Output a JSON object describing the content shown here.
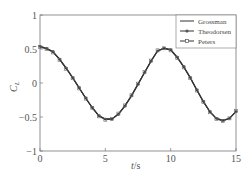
{
  "chart_data": {
    "type": "line",
    "title": "",
    "xlabel": "t/s",
    "ylabel": "C_L",
    "xlim": [
      0,
      15
    ],
    "ylim": [
      -1,
      1
    ],
    "xticks": [
      0,
      5,
      10,
      15
    ],
    "yticks": [
      1,
      0.5,
      0,
      -0.5,
      -1
    ],
    "xtick_labels": [
      "0",
      "5",
      "10",
      "15"
    ],
    "ytick_labels": [
      "1",
      "0.5",
      "0",
      "−0.5",
      "−1"
    ],
    "grid": false,
    "legend_position": "upper right",
    "x": [
      0,
      0.5,
      1,
      1.5,
      2,
      2.5,
      3,
      3.5,
      4,
      4.5,
      5,
      5.5,
      6,
      6.5,
      7,
      7.5,
      8,
      8.5,
      9,
      9.5,
      10,
      10.5,
      11,
      11.5,
      12,
      12.5,
      13,
      13.5,
      14,
      14.5,
      15
    ],
    "series": [
      {
        "name": "Grossman",
        "marker": "none",
        "values": [
          0.54,
          0.51,
          0.46,
          0.35,
          0.22,
          0.08,
          -0.07,
          -0.22,
          -0.36,
          -0.48,
          -0.53,
          -0.53,
          -0.46,
          -0.34,
          -0.19,
          -0.02,
          0.15,
          0.32,
          0.47,
          0.51,
          0.49,
          0.38,
          0.24,
          0.08,
          -0.1,
          -0.27,
          -0.42,
          -0.52,
          -0.55,
          -0.52,
          -0.42
        ]
      },
      {
        "name": "Theodorsen",
        "marker": "circle",
        "values": [
          0.54,
          0.51,
          0.46,
          0.35,
          0.22,
          0.08,
          -0.07,
          -0.22,
          -0.36,
          -0.48,
          -0.53,
          -0.53,
          -0.46,
          -0.34,
          -0.19,
          -0.02,
          0.15,
          0.32,
          0.47,
          0.51,
          0.49,
          0.38,
          0.24,
          0.08,
          -0.1,
          -0.27,
          -0.42,
          -0.52,
          -0.55,
          -0.52,
          -0.42
        ]
      },
      {
        "name": "Peters",
        "marker": "square",
        "values": [
          0.53,
          0.5,
          0.45,
          0.34,
          0.21,
          0.07,
          -0.08,
          -0.23,
          -0.37,
          -0.49,
          -0.54,
          -0.53,
          -0.45,
          -0.33,
          -0.18,
          -0.01,
          0.16,
          0.33,
          0.48,
          0.51,
          0.48,
          0.37,
          0.23,
          0.07,
          -0.11,
          -0.28,
          -0.43,
          -0.53,
          -0.56,
          -0.52,
          -0.41
        ]
      }
    ]
  },
  "legend": {
    "items": [
      {
        "label": "Grossman"
      },
      {
        "label": "Theodorsen"
      },
      {
        "label": "Peters"
      }
    ]
  },
  "axes": {
    "xlabel_italic": "t",
    "xlabel_rest": "/s",
    "ylabel_main": "C",
    "ylabel_sub": "L"
  },
  "colors": {
    "line": "#333333",
    "axis": "#666666"
  }
}
